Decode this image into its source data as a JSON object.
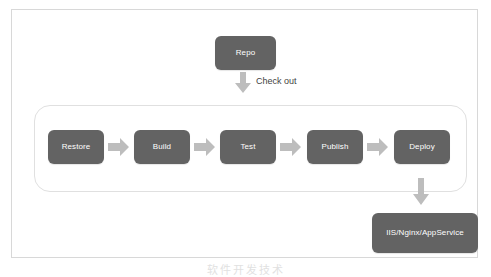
{
  "diagram": {
    "type": "flowchart",
    "colors": {
      "node_fill": "#636363",
      "node_text": "#ffffff",
      "arrow_fill": "#bdbdbd",
      "panel_border": "#d8d8d8",
      "group_border": "#e0e0e0",
      "label_text": "#3f3f3f",
      "background": "#ffffff"
    },
    "source_node": {
      "id": "repo",
      "label": "Repo"
    },
    "edge_label": "Check out",
    "pipeline": {
      "stages": [
        {
          "id": "restore",
          "label": "Restore"
        },
        {
          "id": "build",
          "label": "Build"
        },
        {
          "id": "test",
          "label": "Test"
        },
        {
          "id": "publish",
          "label": "Publish"
        },
        {
          "id": "deploy",
          "label": "Deploy"
        }
      ]
    },
    "target_node": {
      "id": "host",
      "label": "IIS/Nginx/AppService"
    },
    "icons": {
      "arrow_right": "arrow-right-icon",
      "arrow_down": "arrow-down-icon"
    },
    "watermark": "软件开发技术"
  }
}
